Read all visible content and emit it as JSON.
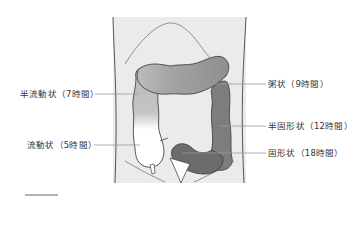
{
  "diagram": {
    "type": "anatomical-illustration",
    "colors": {
      "background": "#ffffff",
      "body_fill": "#ebebeb",
      "body_outline": "#555555",
      "leader_line": "#9a9a9a",
      "label_text": "#333333",
      "segment_fluid": "#ffffff",
      "segment_semi_fluid": "#bdbdbd",
      "segment_mushy": "#a3a3a3",
      "segment_semi_solid": "#7a7a7a",
      "segment_solid": "#6b6b6b"
    },
    "labels": [
      {
        "id": "semi-fluid",
        "text": "半流動状（7時間）",
        "side": "left"
      },
      {
        "id": "mushy",
        "text": "粥状（9時間）",
        "side": "right"
      },
      {
        "id": "semi-solid",
        "text": "半固形状（12時間）",
        "side": "right"
      },
      {
        "id": "fluid",
        "text": "流動状（5時間）",
        "side": "left"
      },
      {
        "id": "solid",
        "text": "固形状（18時間）",
        "side": "right"
      }
    ]
  }
}
